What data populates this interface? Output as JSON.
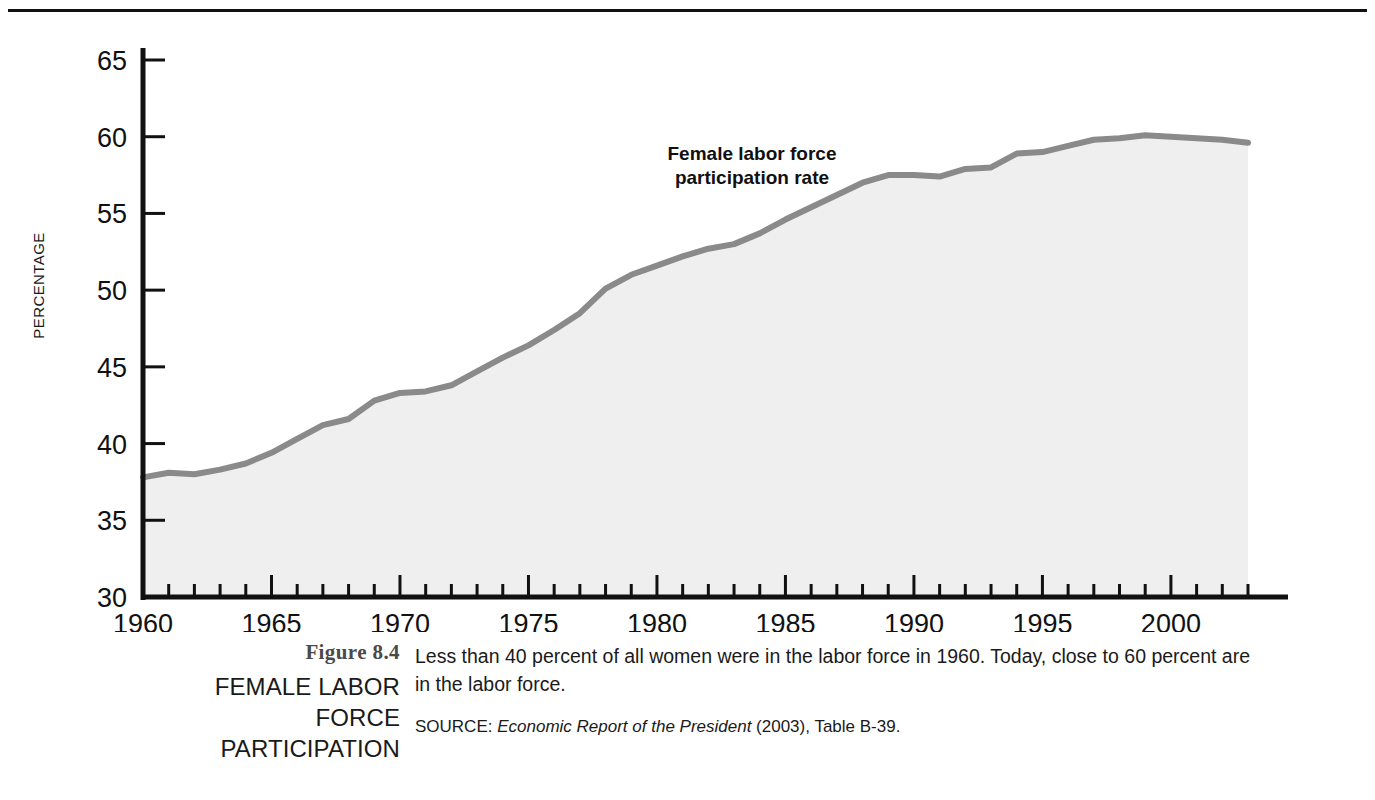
{
  "figure": {
    "number": "Figure 8.4",
    "title_line1": "FEMALE LABOR FORCE",
    "title_line2": "PARTICIPATION",
    "caption": "Less than 40 percent of all women were in the labor force in 1960. Today, close to 60 percent are in the labor force.",
    "source_prefix": "SOURCE: ",
    "source_title": "Economic Report of the President",
    "source_suffix": " (2003), Table B-39."
  },
  "colors": {
    "line": "#8a8a8a",
    "fill": "#efefef",
    "axis": "#111111",
    "text": "#1a1a1a",
    "rule": "#111111"
  },
  "chart_data": {
    "type": "area",
    "title": "",
    "annotation": "Female labor force participation rate",
    "annotation_line1": "Female labor force",
    "annotation_line2": "participation rate",
    "xlabel": "",
    "ylabel": "PERCENTAGE",
    "xlim": [
      1960,
      2003
    ],
    "ylim": [
      30,
      65
    ],
    "ytick_step": 5,
    "xtick_step": 5,
    "minor_xtick_step": 1,
    "grid": false,
    "legend": "none",
    "ytick_labels": [
      "30",
      "35",
      "40",
      "45",
      "50",
      "55",
      "60",
      "65"
    ],
    "ytick_values": [
      30,
      35,
      40,
      45,
      50,
      55,
      60,
      65
    ],
    "xtick_labels": [
      "1960",
      "1965",
      "1970",
      "1975",
      "1980",
      "1985",
      "1990",
      "1995",
      "2000"
    ],
    "xtick_values": [
      1960,
      1965,
      1970,
      1975,
      1980,
      1985,
      1990,
      1995,
      2000
    ],
    "series": [
      {
        "name": "Female labor force participation rate",
        "x": [
          1960,
          1961,
          1962,
          1963,
          1964,
          1965,
          1966,
          1967,
          1968,
          1969,
          1970,
          1971,
          1972,
          1973,
          1974,
          1975,
          1976,
          1977,
          1978,
          1979,
          1980,
          1981,
          1982,
          1983,
          1984,
          1985,
          1986,
          1987,
          1988,
          1989,
          1990,
          1991,
          1992,
          1993,
          1994,
          1995,
          1996,
          1997,
          1998,
          1999,
          2000,
          2001,
          2002,
          2003
        ],
        "values": [
          37.8,
          38.1,
          38.0,
          38.3,
          38.7,
          39.4,
          40.3,
          41.2,
          41.6,
          42.8,
          43.3,
          43.4,
          43.8,
          44.7,
          45.6,
          46.4,
          47.4,
          48.5,
          50.1,
          51.0,
          51.6,
          52.2,
          52.7,
          53.0,
          53.7,
          54.6,
          55.4,
          56.2,
          57.0,
          57.5,
          57.5,
          57.4,
          57.9,
          58.0,
          58.9,
          59.0,
          59.4,
          59.8,
          59.9,
          60.1,
          60.0,
          59.9,
          59.8,
          59.6
        ]
      }
    ]
  }
}
